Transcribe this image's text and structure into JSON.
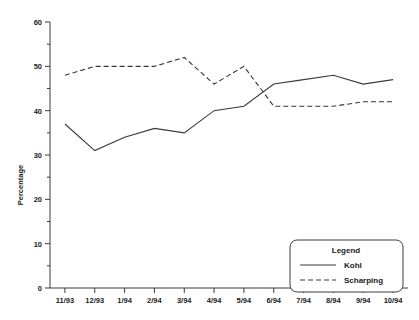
{
  "chart_data": {
    "type": "line",
    "title": "",
    "xlabel": "",
    "ylabel": "Percentage",
    "ylim": [
      0,
      60
    ],
    "yticks": [
      0,
      10,
      20,
      30,
      40,
      50,
      60
    ],
    "ytick_labels": [
      "0",
      "10",
      "20",
      "30",
      "40",
      "50",
      "60"
    ],
    "grid": false,
    "legend_position": "bottom-right",
    "legend_title": "Legend",
    "categories": [
      "11/93",
      "12/93",
      "1/94",
      "2/94",
      "3/94",
      "4/94",
      "5/94",
      "6/94",
      "7/94",
      "8/94",
      "9/94",
      "10/94"
    ],
    "series": [
      {
        "name": "Kohl",
        "style": "solid",
        "color": "#3a3a3a",
        "values": [
          37,
          31,
          34,
          36,
          35,
          40,
          41,
          46,
          47,
          48,
          46,
          47
        ]
      },
      {
        "name": "Scharping",
        "style": "dashed",
        "color": "#3a3a3a",
        "values": [
          48,
          50,
          50,
          50,
          52,
          46,
          50,
          41,
          41,
          41,
          42,
          42
        ]
      }
    ]
  },
  "axes": {
    "y_axis_title": "Percentage"
  },
  "legend": {
    "title": "Legend",
    "entries": [
      {
        "label": "Kohl",
        "style": "solid"
      },
      {
        "label": "Scharping",
        "style": "dashed"
      }
    ]
  }
}
